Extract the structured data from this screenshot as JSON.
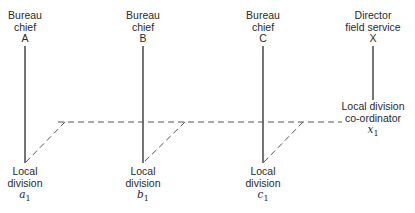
{
  "diagram": {
    "colors": {
      "line": "#2a2a2a",
      "dashed": "#555555",
      "background": "#ffffff"
    },
    "top_nodes": [
      {
        "id": "A",
        "lines": [
          "Bureau",
          "chief",
          "A"
        ],
        "x": 25
      },
      {
        "id": "B",
        "lines": [
          "Bureau",
          "chief",
          "B"
        ],
        "x": 143
      },
      {
        "id": "C",
        "lines": [
          "Bureau",
          "chief",
          "C"
        ],
        "x": 263
      },
      {
        "id": "X",
        "lines": [
          "Director",
          "field service",
          "X"
        ],
        "x": 373
      }
    ],
    "bottom_nodes": [
      {
        "id": "a1",
        "lines": [
          "Local",
          "division"
        ],
        "symbol": "a",
        "subscript": "1",
        "x": 25
      },
      {
        "id": "b1",
        "lines": [
          "Local",
          "division"
        ],
        "symbol": "b",
        "subscript": "1",
        "x": 143
      },
      {
        "id": "c1",
        "lines": [
          "Local",
          "division"
        ],
        "symbol": "c",
        "subscript": "1",
        "x": 263
      }
    ],
    "coordinator": {
      "id": "x1",
      "lines": [
        "Local division",
        "co-ordinator"
      ],
      "symbol": "x",
      "subscript": "1",
      "x": 373
    },
    "solid_edges": [
      {
        "from": "A",
        "to": "a1"
      },
      {
        "from": "B",
        "to": "b1"
      },
      {
        "from": "C",
        "to": "c1"
      },
      {
        "from": "X",
        "to": "x1"
      }
    ],
    "dashed_edges": [
      {
        "from": "x1",
        "to": "a1"
      },
      {
        "from": "x1",
        "to": "b1"
      },
      {
        "from": "x1",
        "to": "c1"
      }
    ]
  }
}
